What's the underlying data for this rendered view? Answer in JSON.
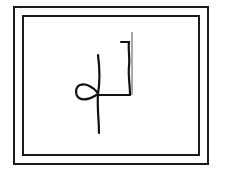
{
  "figure": {
    "frame": {
      "outer_color": "#1a1a1a",
      "inner_color": "#1a1a1a",
      "background": "#ffffff"
    },
    "glyph": {
      "stroke_color": "#111111",
      "accent_line_color": "#8a8a8a",
      "components": [
        "loop",
        "long-vertical-stroke",
        "horizontal-connector",
        "right-vertical-stroke",
        "top-hook",
        "gray-guide-line"
      ]
    }
  }
}
